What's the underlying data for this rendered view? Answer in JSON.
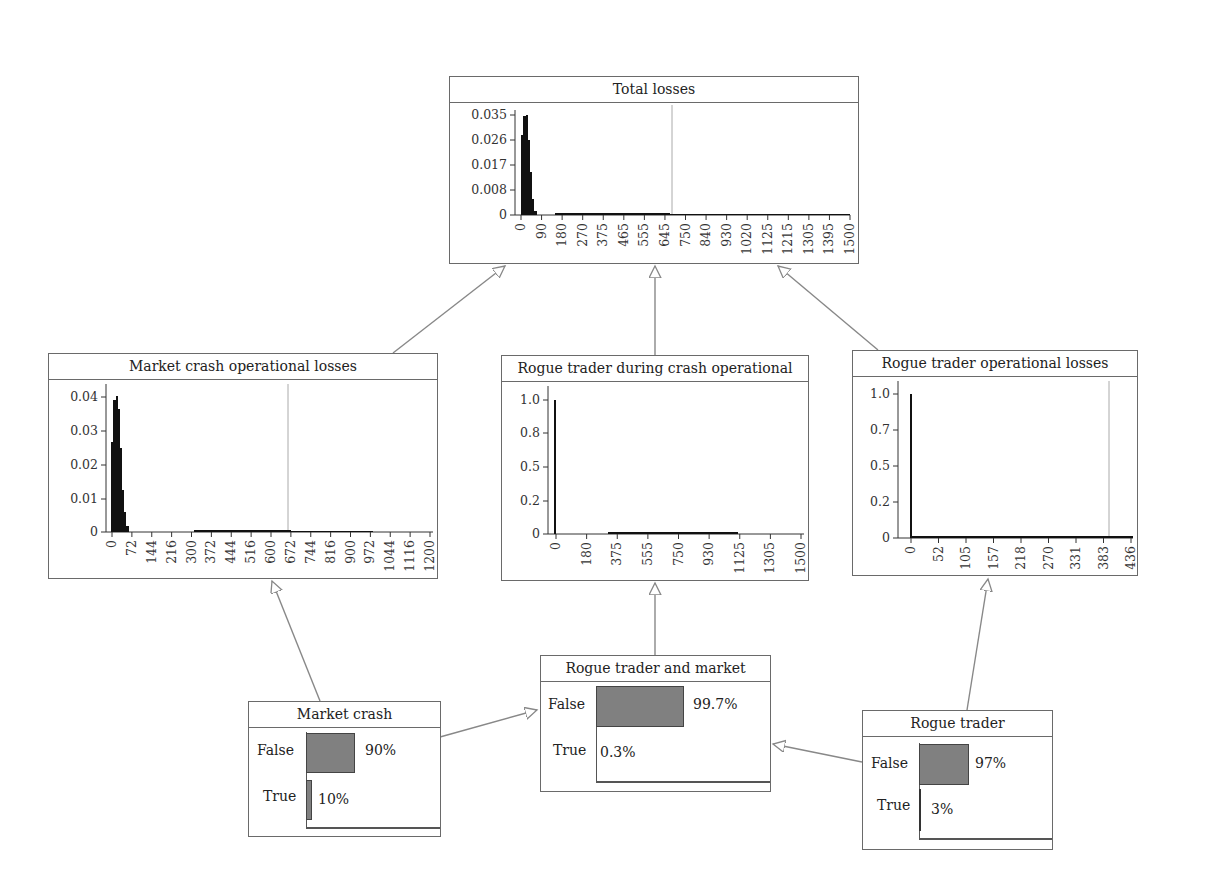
{
  "colors": {
    "border": "#6a6a6a",
    "bar_fill": "#808080",
    "histogram": "#111111",
    "arrow": "#888888",
    "median_line": "#999999"
  },
  "nodes": {
    "total_losses": {
      "title": "Total losses",
      "y_ticks": [
        "0.035",
        "0.026",
        "0.017",
        "0.008",
        "0"
      ],
      "x_ticks": [
        "0",
        "90",
        "180",
        "270",
        "375",
        "465",
        "555",
        "645",
        "750",
        "840",
        "930",
        "1020",
        "1125",
        "1215",
        "1305",
        "1395",
        "1500"
      ]
    },
    "market_crash_op": {
      "title": "Market crash operational losses",
      "y_ticks": [
        "0.04",
        "0.03",
        "0.02",
        "0.01",
        "0"
      ],
      "x_ticks": [
        "0",
        "72",
        "144",
        "216",
        "300",
        "372",
        "444",
        "516",
        "600",
        "672",
        "744",
        "816",
        "900",
        "972",
        "1044",
        "1116",
        "1200"
      ]
    },
    "rogue_during_crash_op": {
      "title": "Rogue trader during crash operational",
      "y_ticks": [
        "1.0",
        "0.8",
        "0.5",
        "0.2",
        "0"
      ],
      "x_ticks": [
        "0",
        "180",
        "375",
        "555",
        "750",
        "930",
        "1125",
        "1305",
        "1500"
      ]
    },
    "rogue_trader_op": {
      "title": "Rogue trader operational losses",
      "y_ticks": [
        "1.0",
        "0.7",
        "0.5",
        "0.2",
        "0"
      ],
      "x_ticks": [
        "0",
        "52",
        "105",
        "157",
        "218",
        "270",
        "331",
        "383",
        "436"
      ]
    },
    "market_crash": {
      "title": "Market crash",
      "states": [
        {
          "label": "False",
          "value": "90%",
          "p": 0.9
        },
        {
          "label": "True",
          "value": "10%",
          "p": 0.1
        }
      ]
    },
    "rogue_and_market": {
      "title": "Rogue trader and market",
      "states": [
        {
          "label": "False",
          "value": "99.7%",
          "p": 0.997
        },
        {
          "label": "True",
          "value": "0.3%",
          "p": 0.003
        }
      ]
    },
    "rogue_trader": {
      "title": "Rogue trader",
      "states": [
        {
          "label": "False",
          "value": "97%",
          "p": 0.97
        },
        {
          "label": "True",
          "value": "3%",
          "p": 0.03
        }
      ]
    }
  },
  "edges": [
    {
      "from": "Market crash operational losses",
      "to": "Total losses"
    },
    {
      "from": "Rogue trader during crash operational",
      "to": "Total losses"
    },
    {
      "from": "Rogue trader operational losses",
      "to": "Total losses"
    },
    {
      "from": "Market crash",
      "to": "Market crash operational losses"
    },
    {
      "from": "Market crash",
      "to": "Rogue trader and market"
    },
    {
      "from": "Rogue trader and market",
      "to": "Rogue trader during crash operational"
    },
    {
      "from": "Rogue trader",
      "to": "Rogue trader and market"
    },
    {
      "from": "Rogue trader",
      "to": "Rogue trader operational losses"
    }
  ]
}
